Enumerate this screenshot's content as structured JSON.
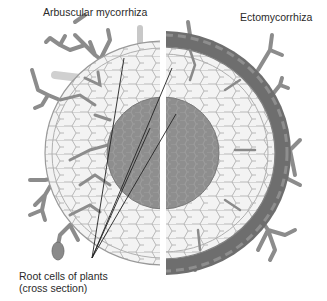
{
  "labels": {
    "arbuscular": "Arbuscular mycorrhiza",
    "ecto": "Ectomycorrhiza",
    "root_line1": "Root cells of plants",
    "root_line2": "(cross section)"
  },
  "colors": {
    "background": "#ffffff",
    "cell_fill": "#f2f2f2",
    "cell_stroke": "#9a9a9a",
    "stele": "#8a8a8a",
    "hyphae": "#8c8c8c",
    "mantle": "#6e6e6e",
    "leader_lines": "#222222",
    "text": "#2a2a2a"
  },
  "diagram": {
    "center": [
      163,
      153
    ],
    "cortex_radius": [
      128,
      118
    ],
    "stele_radius": 56,
    "split_x": 163,
    "leader_origin": [
      92,
      258
    ],
    "leader_targets": [
      [
        124,
        58
      ],
      [
        172,
        68
      ],
      [
        176,
        114
      ],
      [
        150,
        128
      ]
    ]
  }
}
